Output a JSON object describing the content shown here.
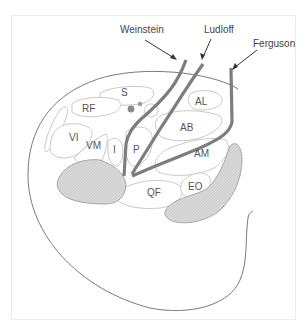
{
  "figure": {
    "type": "cross-section diagram",
    "colors": {
      "frame_border": "#ececec",
      "outline": "#7a7a7a",
      "muscle_stroke": "#c9c9c9",
      "bone_fill": "#d6d6d6",
      "approach_line": "#7d7d7d",
      "label_text": "#555555",
      "arrow": "#333333"
    }
  },
  "approaches": [
    {
      "id": "weinstein",
      "label": "Weinstein"
    },
    {
      "id": "ludloff",
      "label": "Ludloff"
    },
    {
      "id": "ferguson",
      "label": "Ferguson"
    }
  ],
  "muscles": {
    "S": "S",
    "RF": "RF",
    "VI": "VI",
    "VM": "VM",
    "I": "I",
    "P": "P",
    "AL": "AL",
    "AB": "AB",
    "AM": "AM",
    "QF": "QF",
    "EO": "EO"
  }
}
